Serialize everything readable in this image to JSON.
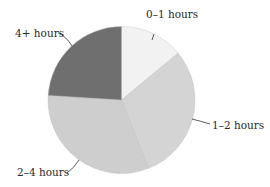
{
  "chart_data": {
    "type": "pie",
    "title": "",
    "start_angle_deg": 0,
    "direction": "clockwise",
    "categories": [
      "0–1 hours",
      "1–2 hours",
      "2–4 hours",
      "4+ hours"
    ],
    "values": [
      14,
      30,
      32,
      24
    ],
    "unit": "percent (estimated from slice angles)",
    "colors": [
      "#f2f2f2",
      "#d4d4d4",
      "#cecece",
      "#6f6f6f"
    ],
    "legend": "none (direct labels with leader lines)"
  },
  "labels": {
    "l0": "0–1 hours",
    "l1": "1–2 hours",
    "l2": "2–4 hours",
    "l3": "4+ hours"
  }
}
